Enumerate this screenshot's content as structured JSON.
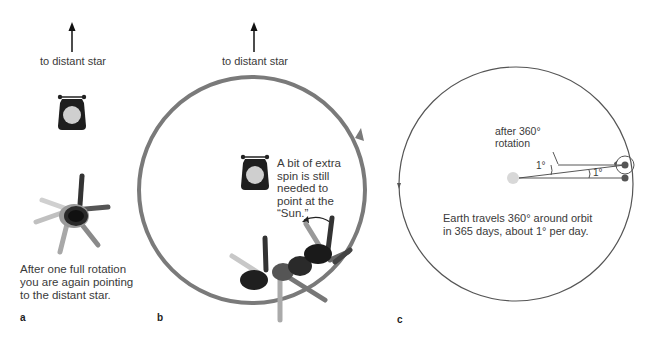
{
  "panels": {
    "a": {
      "letter": "a",
      "star_label": "to distant star",
      "caption_lines": [
        "After one full rotation",
        "you are again pointing",
        "to the distant star."
      ]
    },
    "b": {
      "letter": "b",
      "star_label": "to distant star",
      "caption_lines": [
        "A bit of extra",
        "spin is still",
        "needed to",
        "point at the",
        "“Sun.”"
      ]
    },
    "c": {
      "letter": "c",
      "rotation_label_lines": [
        "after 360°",
        "rotation"
      ],
      "angle_label_left": "1°",
      "angle_label_right": "1°",
      "caption_lines": [
        "Earth travels 360° around orbit",
        "in 365 days, about 1° per day."
      ]
    }
  },
  "colors": {
    "orbit_b": "#7a7a7a",
    "orbit_c": "#555555",
    "sun_gray": "#d8d8d8",
    "lamp_dark": "#222222",
    "earth_dot": "#555555"
  }
}
